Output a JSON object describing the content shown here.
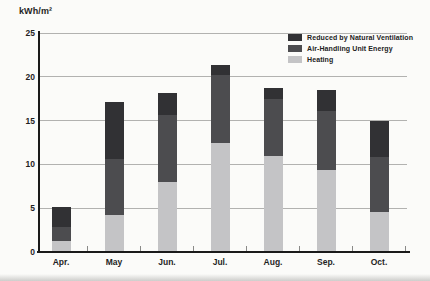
{
  "chart_data": {
    "type": "bar",
    "stacked": true,
    "title": "",
    "ylabel": "kWh/m²",
    "xlabel": "",
    "ylim": [
      0,
      25
    ],
    "yticks": [
      0,
      5,
      10,
      15,
      20,
      25
    ],
    "grid": "horizontal",
    "legend_position": "top-right",
    "categories": [
      "Apr.",
      "May",
      "Jun.",
      "Jul.",
      "Aug.",
      "Sep.",
      "Oct."
    ],
    "series": [
      {
        "name": "Heating",
        "color": "#c4c4c6",
        "values": [
          1.2,
          4.2,
          8.0,
          12.4,
          11.0,
          9.4,
          4.6
        ]
      },
      {
        "name": "Air-Handling Unit Energy",
        "color": "#4c4c4f",
        "values": [
          1.7,
          6.4,
          7.6,
          7.8,
          6.5,
          6.7,
          6.3
        ]
      },
      {
        "name": "Reduced by Natural Ventilation",
        "color": "#313134",
        "values": [
          2.2,
          6.5,
          2.5,
          1.2,
          1.2,
          2.4,
          4.1
        ]
      }
    ],
    "stack_totals": [
      5.1,
      17.1,
      18.1,
      21.4,
      18.7,
      18.5,
      15.0
    ],
    "legend_order": [
      "Reduced by Natural Ventilation",
      "Air-Handling Unit Energy",
      "Heating"
    ]
  },
  "colors": {
    "axis": "#1a1a1a",
    "gridline": "#b2b2b0",
    "background": "#fbfbf9",
    "text": "#1f1f1f"
  }
}
